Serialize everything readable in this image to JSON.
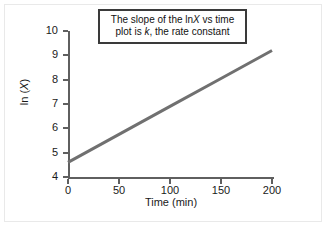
{
  "figure": {
    "background_color": "#ffffff",
    "frame_color": "#e9e9e9",
    "axis_color": "#5f5f5f",
    "line_color": "#707070",
    "annotation_border_color": "#3a3a3a"
  },
  "annotation": {
    "line1_part1": "The slope of the ln",
    "line1_italic": "X",
    "line1_part2": " vs time",
    "line2_part1": "plot is ",
    "line2_italic": "k",
    "line2_part2": ", the rate constant",
    "full_text": "The slope of the lnX vs time plot is k, the rate constant"
  },
  "chart_data": {
    "type": "line",
    "title": "",
    "xlabel": "Time (min)",
    "ylabel_prefix": "ln (",
    "ylabel_italic": "X",
    "ylabel_suffix": ")",
    "ylabel": "ln (X)",
    "xlim": [
      0,
      200
    ],
    "ylim": [
      4,
      10
    ],
    "xticks": [
      0,
      50,
      100,
      150,
      200
    ],
    "xtick_labels": [
      "0",
      "50",
      "100",
      "150",
      "200"
    ],
    "yticks": [
      4,
      5,
      6,
      7,
      8,
      9,
      10
    ],
    "ytick_labels": [
      "4",
      "5",
      "6",
      "7",
      "8",
      "9",
      "10"
    ],
    "grid": false,
    "legend": false,
    "series": [
      {
        "name": "ln (X) vs time",
        "x": [
          0,
          50,
          100,
          150,
          200
        ],
        "y": [
          4.6,
          5.75,
          6.9,
          8.05,
          9.2
        ],
        "color": "#707070",
        "linewidth": 3,
        "intercept": 4.6,
        "slope": 0.023
      }
    ]
  }
}
